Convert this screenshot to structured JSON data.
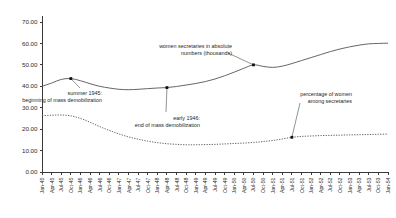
{
  "chart_data": {
    "type": "line",
    "title": "",
    "xlabel": "",
    "ylabel": "",
    "ylim": [
      0,
      70
    ],
    "ytick_step": 10,
    "grid": false,
    "legend_position": "none",
    "y_tick_labels": [
      "0.00",
      "10.00",
      "20.00",
      "30.00",
      "40.00",
      "50.00",
      "60.00",
      "70.00"
    ],
    "categories": [
      "Jan-45",
      "Apr-45",
      "Jul-45",
      "Oct-45",
      "Jan-46",
      "Apr-46",
      "Jul-46",
      "Oct-46",
      "Jan-47",
      "Apr-47",
      "Jul-47",
      "Oct-47",
      "Jan-48",
      "Apr-48",
      "Jul-48",
      "Oct-48",
      "Jan-49",
      "Apr-49",
      "Jul-49",
      "Oct-49",
      "Jan-50",
      "Apr-50",
      "Jul-50",
      "Oct-50",
      "Jan-51",
      "Apr-51",
      "Jul-51",
      "Oct-51",
      "Jan-52",
      "Apr-52",
      "Jul-52",
      "Oct-52",
      "Jan-53",
      "Apr-53",
      "Jul-53",
      "Oct-53",
      "Jan-54"
    ],
    "series": [
      {
        "name": "women secretaries in absolute numbers (thousands)",
        "style": "solid",
        "values": [
          40.0,
          41.5,
          43.2,
          43.6,
          42.6,
          41.2,
          40.0,
          39.2,
          38.6,
          38.4,
          38.6,
          38.9,
          39.2,
          39.4,
          39.9,
          40.6,
          41.3,
          42.2,
          43.4,
          44.9,
          46.6,
          48.4,
          50.0,
          49.3,
          48.8,
          49.4,
          50.6,
          52.0,
          53.4,
          54.8,
          56.2,
          57.4,
          58.4,
          59.2,
          59.8,
          60.0,
          60.1
        ]
      },
      {
        "name": "percentage of women among secretaries",
        "style": "dotted",
        "values": [
          26.3,
          26.5,
          26.6,
          26.2,
          25.0,
          23.2,
          21.2,
          19.4,
          17.8,
          16.4,
          15.3,
          14.4,
          13.7,
          13.2,
          12.9,
          12.7,
          12.7,
          12.8,
          12.9,
          13.1,
          13.3,
          13.5,
          13.8,
          14.2,
          14.7,
          15.4,
          16.2,
          16.6,
          16.8,
          17.0,
          17.1,
          17.2,
          17.3,
          17.4,
          17.5,
          17.6,
          17.7
        ]
      }
    ],
    "annotations": [
      {
        "id": "summer-1945",
        "lines": [
          "summer 1945:",
          "beginning of mass demobilization"
        ],
        "point_category": "Oct-45",
        "point_value": 43.6,
        "series": "women secretaries in absolute numbers (thousands)"
      },
      {
        "id": "early-1946",
        "lines": [
          "early 1946:",
          "end of mass demobilization"
        ],
        "point_category": "Apr-48",
        "point_value": 39.4,
        "series": "women secretaries in absolute numbers (thousands)"
      },
      {
        "id": "secretaries-absolute",
        "lines": [
          "women secretaries in absolute",
          "numbers (thousands)"
        ],
        "point_category": "Jul-50",
        "point_value": 50.0,
        "series": "women secretaries in absolute numbers (thousands)"
      },
      {
        "id": "percentage-women",
        "lines": [
          "percentage of women",
          "among secretaries"
        ],
        "point_category": "Jul-51",
        "point_value": 16.2,
        "series": "percentage of women among secretaries"
      }
    ]
  }
}
